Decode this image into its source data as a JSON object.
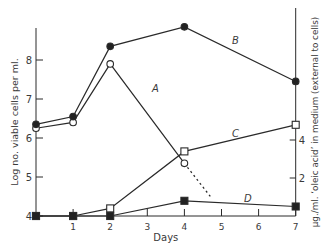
{
  "chart_data": {
    "type": "line",
    "title": "",
    "xlabel": "Days",
    "ylabel": "Log no. viable cells per ml.",
    "y2label": "μg./ml. ‘oleic acid’ in medium (external to cells)",
    "x_ticks": [
      "1",
      "2",
      "3",
      "4",
      "5",
      "6",
      "7"
    ],
    "y_ticks": [
      "4",
      "5",
      "6",
      "7",
      "8"
    ],
    "y2_ticks": [
      "2",
      "4"
    ],
    "xlim": [
      0,
      7
    ],
    "ylim": [
      4,
      9
    ],
    "y2lim": [
      0,
      10
    ],
    "grid": false,
    "legend": "inline labels A, B, C, D",
    "series": [
      {
        "name": "A",
        "axis": "left",
        "marker": "open-circle",
        "x": [
          0,
          1,
          2,
          4
        ],
        "values": [
          6.25,
          6.4,
          7.9,
          5.35
        ],
        "extrapolation": {
          "style": "dotted",
          "to_x": 4.7,
          "to_value": 4.5
        }
      },
      {
        "name": "B",
        "axis": "left",
        "marker": "filled-circle",
        "x": [
          0,
          1,
          2,
          4,
          7
        ],
        "values": [
          6.35,
          6.55,
          8.35,
          8.85,
          7.45
        ]
      },
      {
        "name": "C",
        "axis": "right",
        "marker": "open-square",
        "x": [
          0,
          1,
          2,
          4,
          7
        ],
        "values": [
          0,
          0,
          0.4,
          3.4,
          4.8
        ]
      },
      {
        "name": "D",
        "axis": "right",
        "marker": "filled-square",
        "x": [
          0,
          1,
          2,
          4,
          7
        ],
        "values": [
          0,
          0,
          0,
          0.8,
          0.5
        ]
      }
    ]
  }
}
